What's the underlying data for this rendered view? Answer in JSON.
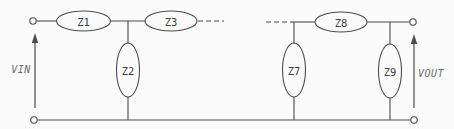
{
  "schematic": {
    "impedances": {
      "z1": "Z1",
      "z2": "Z2",
      "z3": "Z3",
      "z7": "Z7",
      "z8": "Z8",
      "z9": "Z9"
    },
    "ports": {
      "input_label": "VIN",
      "output_label": "VOUT"
    },
    "colors": {
      "wire": "#4c4c4c",
      "component_label": "#3e3e3e",
      "port_label": "#6e6e6e",
      "background": "#fbfbfb"
    }
  }
}
